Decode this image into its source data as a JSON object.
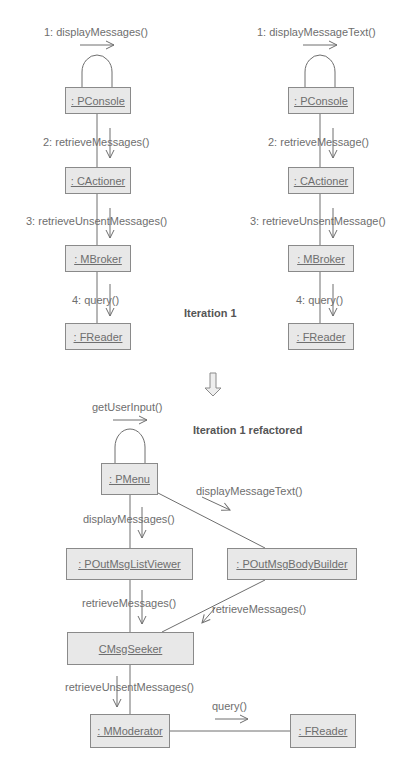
{
  "diagram": {
    "iteration1_label": "Iteration 1",
    "refactored_label": "Iteration 1 refactored",
    "left_column": {
      "objects": [
        ": PConsole",
        ": CActioner",
        ": MBroker",
        ": FReader"
      ],
      "messages": [
        "1: displayMessages()",
        "2: retrieveMessages()",
        "3: retrieveUnsentMessages()",
        "4: query()"
      ]
    },
    "right_column": {
      "objects": [
        ": PConsole",
        ": CActioner",
        ": MBroker",
        ": FReader"
      ],
      "messages": [
        "1: displayMessageText()",
        "2: retrieveMessage()",
        "3: retrieveUnsentMessage()",
        "4: query()"
      ]
    },
    "refactored": {
      "objects": {
        "pmenu": ": PMenu",
        "list_viewer": ": POutMsgListViewer",
        "body_builder": ": POutMsgBodyBuilder",
        "seeker": "CMsgSeeker",
        "moderator": ": MModerator",
        "reader": ": FReader"
      },
      "messages": {
        "self": "getUserInput()",
        "to_list_viewer": "displayMessages()",
        "to_body_builder": "displayMessageText()",
        "list_to_seeker": "retrieveMessages()",
        "builder_to_seeker": "retrieveMessages()",
        "seeker_to_moderator": "retrieveUnsentMessages()",
        "moderator_to_reader": "query()"
      }
    },
    "colors": {
      "box_fill": "#e8e8e8",
      "line": "#6e6e6e",
      "text": "#6e6e6e",
      "heading": "#555555"
    }
  }
}
